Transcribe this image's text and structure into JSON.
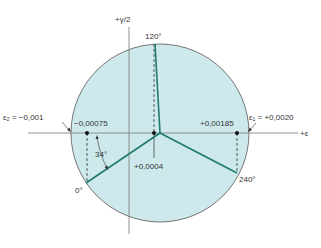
{
  "figure": {
    "axes": {
      "horizontal_label": "+ε",
      "vertical_label": "+γ/2"
    },
    "labels": {
      "angle_120": "120°",
      "angle_240": "240°",
      "angle_0": "0°",
      "angle_34": "34°",
      "eps2": "ε₂ = −0,001",
      "eps1": "ε₁ = +0,0020",
      "value_left": "−0,00075",
      "value_right": "+0,00185",
      "value_center": "+0,0004"
    },
    "colors": {
      "circle_fill": "#cde9ec",
      "circle_stroke": "#555555",
      "branch": "#1f7a6e",
      "axis": "#777777",
      "point": "#111111"
    }
  }
}
